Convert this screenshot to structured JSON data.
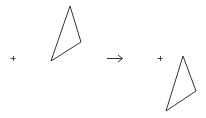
{
  "diagram": {
    "type": "geometric-transformation",
    "stroke_color": "#333333",
    "background": "#ffffff",
    "before": {
      "center_marker": {
        "x": 13,
        "y": 58,
        "glyph": "plus"
      },
      "triangle": [
        [
          70,
          6
        ],
        [
          81,
          42
        ],
        [
          51,
          61
        ]
      ]
    },
    "arrow": {
      "x1": 107,
      "x2": 122,
      "y": 58,
      "glyph": "right-arrow"
    },
    "after": {
      "center_marker": {
        "x": 160,
        "y": 58,
        "glyph": "plus"
      },
      "triangle": [
        [
          183,
          56
        ],
        [
          196,
          91
        ],
        [
          166,
          111
        ]
      ]
    }
  }
}
